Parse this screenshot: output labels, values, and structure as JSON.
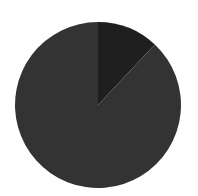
{
  "chart_data": {
    "type": "pie",
    "title": "",
    "categories": [
      "Slice A",
      "Slice B"
    ],
    "values": [
      12,
      88
    ],
    "colors": [
      "#1f1f1f",
      "#333333"
    ],
    "start_angle_deg": 90,
    "direction": "clockwise",
    "legend": null,
    "center": [
      98,
      105
    ],
    "radius": 83
  }
}
